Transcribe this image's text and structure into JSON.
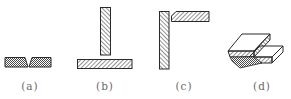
{
  "figure": {
    "panels": [
      {
        "id": "a",
        "label": "(a)",
        "joint": "butt-joint"
      },
      {
        "id": "b",
        "label": "(b)",
        "joint": "t-joint"
      },
      {
        "id": "c",
        "label": "(c)",
        "joint": "corner-joint"
      },
      {
        "id": "d",
        "label": "(d)",
        "joint": "lap-joint"
      }
    ]
  },
  "colors": {
    "outline": "#2a2a2a",
    "hatch": "#3a3a3a",
    "fill": "#ffffff",
    "label": "#6a6a6a"
  }
}
